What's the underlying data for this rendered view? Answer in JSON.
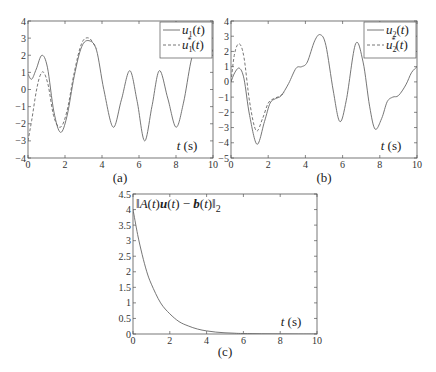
{
  "chart_data": [
    {
      "id": "a",
      "type": "line",
      "caption": "(a)",
      "xlabel": "t (s)",
      "xlim": [
        0,
        10
      ],
      "ylim": [
        -4,
        4
      ],
      "xticks": [
        0,
        2,
        4,
        6,
        8,
        10
      ],
      "yticks": [
        -4,
        -3,
        -2,
        -1,
        0,
        1,
        2,
        3,
        4
      ],
      "legend": {
        "position": "top-right",
        "entries": [
          "u1(t)",
          "u1*(t)"
        ]
      },
      "series": [
        {
          "name": "u1(t)",
          "style": "solid",
          "x": [
            0,
            0.2,
            0.45,
            0.75,
            1.05,
            1.4,
            1.75,
            2.1,
            2.5,
            2.9,
            3.3,
            3.7,
            4.1,
            4.6,
            5.05,
            5.5,
            5.9,
            6.3,
            6.7,
            7.1,
            7.55,
            8.0,
            8.4,
            8.8,
            9.1,
            9.4,
            9.7,
            10
          ],
          "y": [
            0.9,
            0.6,
            1.2,
            2.0,
            1.3,
            -1.3,
            -2.5,
            -1.6,
            0.8,
            2.5,
            2.85,
            2.3,
            0.0,
            -2.2,
            -0.6,
            1.1,
            -0.7,
            -3.0,
            -1.0,
            1.1,
            -0.5,
            -2.2,
            -0.8,
            1.6,
            2.7,
            3.0,
            2.8,
            2.2
          ]
        },
        {
          "name": "u1*(t)",
          "style": "dashed",
          "x": [
            0,
            0.2,
            0.45,
            0.65,
            0.85,
            1.1,
            1.4,
            1.75,
            2.1,
            2.5,
            2.9,
            3.3,
            3.7
          ],
          "y": [
            -3.0,
            -1.8,
            -0.1,
            0.8,
            1.0,
            0.2,
            -1.6,
            -2.2,
            -1.3,
            1.0,
            2.7,
            3.0,
            2.4
          ]
        }
      ]
    },
    {
      "id": "b",
      "type": "line",
      "caption": "(b)",
      "xlabel": "t (s)",
      "xlim": [
        0,
        10
      ],
      "ylim": [
        -5,
        4
      ],
      "xticks": [
        0,
        2,
        4,
        6,
        8,
        10
      ],
      "yticks": [
        -5,
        -4,
        -3,
        -2,
        -1,
        0,
        1,
        2,
        3,
        4
      ],
      "legend": {
        "position": "top-right",
        "entries": [
          "u2(t)",
          "u2*(t)"
        ]
      },
      "series": [
        {
          "name": "u2(t)",
          "style": "solid",
          "x": [
            0,
            0.2,
            0.45,
            0.7,
            1.0,
            1.4,
            1.8,
            2.1,
            2.4,
            2.7,
            3.1,
            3.5,
            3.8,
            4.1,
            4.5,
            4.8,
            5.1,
            5.5,
            5.85,
            6.2,
            6.7,
            7.1,
            7.45,
            7.75,
            8.1,
            8.4,
            8.7,
            9.0,
            9.4,
            9.7,
            10
          ],
          "y": [
            0.0,
            0.6,
            0.9,
            0.2,
            -2.2,
            -4.1,
            -2.6,
            -1.4,
            -1.1,
            -0.9,
            -0.1,
            0.9,
            1.0,
            1.3,
            2.7,
            3.1,
            2.4,
            -0.6,
            -2.6,
            -1.2,
            2.5,
            1.3,
            -1.6,
            -3.1,
            -2.4,
            -1.3,
            -1.0,
            -0.9,
            -0.2,
            0.6,
            1.0
          ]
        },
        {
          "name": "u2*(t)",
          "style": "dashed",
          "x": [
            0,
            0.2,
            0.45,
            0.7,
            1.0,
            1.35,
            1.7,
            2.0,
            2.3,
            2.6,
            2.9
          ],
          "y": [
            0.0,
            1.9,
            2.5,
            1.6,
            -1.3,
            -3.2,
            -2.4,
            -1.4,
            -1.1,
            -0.95,
            -0.7
          ]
        }
      ]
    },
    {
      "id": "c",
      "type": "line",
      "caption": "(c)",
      "xlabel": "t (s)",
      "ylabel_annotation": "||A(t)u(t) - b(t)||2",
      "xlim": [
        0,
        10
      ],
      "ylim": [
        0,
        4.5
      ],
      "xticks": [
        0,
        2,
        4,
        6,
        8,
        10
      ],
      "yticks": [
        0,
        0.5,
        1,
        1.5,
        2,
        2.5,
        3,
        3.5,
        4,
        4.5
      ],
      "series": [
        {
          "name": "residual",
          "style": "solid",
          "x": [
            0,
            0.25,
            0.5,
            0.75,
            1,
            1.5,
            2,
            2.5,
            3,
            3.5,
            4,
            4.5,
            5,
            5.5,
            6,
            7,
            8,
            9,
            10
          ],
          "y": [
            4.0,
            3.2,
            2.55,
            2.0,
            1.6,
            1.0,
            0.65,
            0.4,
            0.26,
            0.16,
            0.1,
            0.06,
            0.04,
            0.025,
            0.015,
            0.006,
            0.002,
            0.001,
            0.0
          ]
        }
      ]
    }
  ]
}
